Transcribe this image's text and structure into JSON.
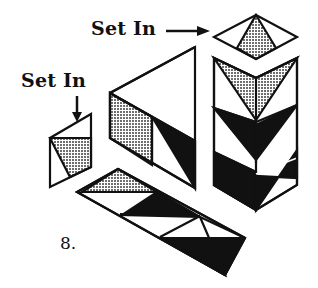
{
  "diagram": {
    "figure_number": "8.",
    "labels": {
      "set_in_top": "Set In",
      "set_in_left": "Set In"
    },
    "colors": {
      "ink": "#111111",
      "fill_solid": "#111111",
      "fill_stipple": "#8a8a8a",
      "background": "#ffffff"
    },
    "pieces": [
      {
        "name": "top-diamond",
        "description": "diamond set-in piece with stippled center triangle"
      },
      {
        "name": "right-column",
        "description": "vertical unit with stippled chevron and two solid/white chevron rows"
      },
      {
        "name": "middle-triangle-unit",
        "description": "large white triangle with stippled and solid triangle strip"
      },
      {
        "name": "left-small-piece",
        "description": "small parallelogram set-in piece with stippled triangle"
      },
      {
        "name": "bottom-strip",
        "description": "diagonal strip of stippled, white and solid triangles"
      }
    ]
  }
}
